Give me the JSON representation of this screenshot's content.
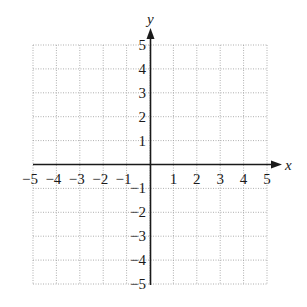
{
  "chart_data": {
    "type": "scatter",
    "title": "",
    "xlabel": "x",
    "ylabel": "y",
    "xlim": [
      -5,
      5
    ],
    "ylim": [
      -5,
      5
    ],
    "grid": true,
    "grid_style": "dotted",
    "x_ticks": [
      -5,
      -4,
      -3,
      -2,
      -1,
      1,
      2,
      3,
      4,
      5
    ],
    "y_ticks": [
      -5,
      -4,
      -3,
      -2,
      -1,
      1,
      2,
      3,
      4,
      5
    ],
    "x_tick_labels": [
      "−5",
      "−4",
      "−3",
      "−2",
      "−1",
      "1",
      "2",
      "3",
      "4",
      "5"
    ],
    "y_tick_labels": [
      "−5",
      "−4",
      "−3",
      "−2",
      "−1",
      "1",
      "2",
      "3",
      "4",
      "5"
    ],
    "series": [],
    "legend": null
  },
  "colors": {
    "axis": "#1a1a1a",
    "grid": "#9a9a9a",
    "background": "#ffffff"
  }
}
